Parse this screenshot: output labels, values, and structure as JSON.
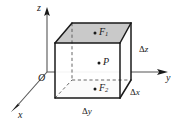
{
  "figure": {
    "axes": {
      "z_label": "z",
      "y_label": "y",
      "x_label": "x",
      "origin_label": "O"
    },
    "points": {
      "top_face_point": "F",
      "top_face_point_sub": "1",
      "center_point": "P",
      "bottom_face_point": "F",
      "bottom_face_point_sub": "2"
    },
    "dimensions": {
      "height_label": "Δ",
      "height_var": "z",
      "depth_label": "Δ",
      "depth_var": "x",
      "width_label": "Δ",
      "width_var": "y"
    },
    "colors": {
      "background": "#ffffff",
      "line": "#1a1a1a",
      "axis": "#4d4d4d",
      "shaded_face": "#c9c9c9",
      "side_face": "#ffffff",
      "dashed": "#555555"
    }
  }
}
